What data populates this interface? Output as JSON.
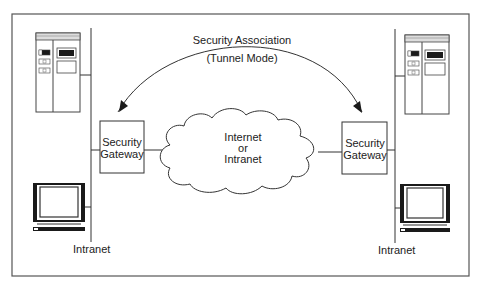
{
  "diagram": {
    "security_association": {
      "line1": "Security Association",
      "line2": "(Tunnel Mode)"
    },
    "cloud": {
      "line1": "Internet",
      "line2": "or",
      "line3": "Intranet"
    },
    "left_gateway": {
      "line1": "Security",
      "line2": "Gateway"
    },
    "right_gateway": {
      "line1": "Security",
      "line2": "Gateway"
    },
    "left_network_label": "Intranet",
    "right_network_label": "Intranet",
    "nodes": [
      {
        "id": "left-server",
        "icon": "server-tower-icon"
      },
      {
        "id": "left-workstation",
        "icon": "computer-monitor-icon"
      },
      {
        "id": "left-gateway",
        "icon": "gateway-box"
      },
      {
        "id": "cloud",
        "icon": "cloud-icon"
      },
      {
        "id": "right-gateway",
        "icon": "gateway-box"
      },
      {
        "id": "right-server",
        "icon": "server-tower-icon"
      },
      {
        "id": "right-workstation",
        "icon": "computer-monitor-icon"
      }
    ],
    "colors": {
      "line": "#333333",
      "frame": "#555555",
      "fill_dark": "#1a1a1a",
      "background": "#ffffff"
    }
  }
}
